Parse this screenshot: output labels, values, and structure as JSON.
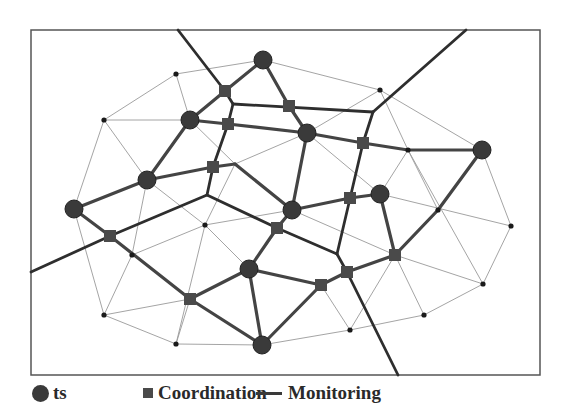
{
  "figure": {
    "type": "network-diagram",
    "frame": {
      "x": 31,
      "y": 30,
      "width": 509,
      "height": 345
    }
  },
  "legend": {
    "items": [
      {
        "symbol": "circle",
        "label": "ts"
      },
      {
        "symbol": "square",
        "label": "Coordination"
      },
      {
        "symbol": "line",
        "label": "Monitoring"
      }
    ]
  },
  "colors": {
    "ts_node": "#3a3a3a",
    "coordination_node": "#4a4a4a",
    "monitoring_line": "#2e2e2e",
    "thick_edge": "#444444",
    "thin_edge": "#9a9a9a",
    "dot": "#1a1a1a",
    "frame": "#555555"
  },
  "nodes": {
    "ts": [
      [
        263,
        60
      ],
      [
        190,
        120
      ],
      [
        307,
        133
      ],
      [
        147,
        180
      ],
      [
        74,
        209
      ],
      [
        380,
        194
      ],
      [
        482,
        150
      ],
      [
        292,
        210
      ],
      [
        249,
        269
      ],
      [
        262,
        345
      ]
    ],
    "coordination": [
      [
        225,
        91
      ],
      [
        289,
        106
      ],
      [
        228,
        124
      ],
      [
        363,
        143
      ],
      [
        213,
        167
      ],
      [
        110,
        236
      ],
      [
        350,
        198
      ],
      [
        277,
        228
      ],
      [
        395,
        255
      ],
      [
        347,
        272
      ],
      [
        321,
        285
      ],
      [
        190,
        299
      ]
    ],
    "dots": [
      [
        176,
        74
      ],
      [
        104,
        120
      ],
      [
        380,
        90
      ],
      [
        511,
        226
      ],
      [
        483,
        284
      ],
      [
        424,
        315
      ],
      [
        350,
        330
      ],
      [
        104,
        315
      ],
      [
        176,
        344
      ],
      [
        205,
        225
      ],
      [
        132,
        255
      ],
      [
        408,
        150
      ],
      [
        438,
        210
      ]
    ]
  },
  "edges": {
    "monitoring": [
      [
        [
          178,
          30
        ],
        [
          225,
          91
        ]
      ],
      [
        [
          225,
          91
        ],
        [
          233,
          104
        ]
      ],
      [
        [
          233,
          104
        ],
        [
          373,
          112
        ]
      ],
      [
        [
          373,
          112
        ],
        [
          466,
          30
        ]
      ],
      [
        [
          373,
          112
        ],
        [
          363,
          143
        ]
      ],
      [
        [
          363,
          143
        ],
        [
          337,
          254
        ]
      ],
      [
        [
          233,
          104
        ],
        [
          228,
          124
        ]
      ],
      [
        [
          228,
          124
        ],
        [
          213,
          167
        ]
      ],
      [
        [
          213,
          167
        ],
        [
          207,
          195
        ]
      ],
      [
        [
          207,
          195
        ],
        [
          110,
          236
        ]
      ],
      [
        [
          110,
          236
        ],
        [
          31,
          272
        ]
      ],
      [
        [
          207,
          195
        ],
        [
          277,
          228
        ]
      ],
      [
        [
          277,
          228
        ],
        [
          337,
          254
        ]
      ],
      [
        [
          337,
          254
        ],
        [
          347,
          272
        ]
      ],
      [
        [
          347,
          272
        ],
        [
          398,
          375
        ]
      ]
    ],
    "thick": [
      [
        [
          263,
          60
        ],
        [
          225,
          91
        ]
      ],
      [
        [
          225,
          91
        ],
        [
          190,
          120
        ]
      ],
      [
        [
          263,
          60
        ],
        [
          289,
          106
        ]
      ],
      [
        [
          289,
          106
        ],
        [
          307,
          133
        ]
      ],
      [
        [
          190,
          120
        ],
        [
          228,
          124
        ]
      ],
      [
        [
          228,
          124
        ],
        [
          307,
          133
        ]
      ],
      [
        [
          307,
          133
        ],
        [
          363,
          143
        ]
      ],
      [
        [
          363,
          143
        ],
        [
          408,
          150
        ]
      ],
      [
        [
          408,
          150
        ],
        [
          482,
          150
        ]
      ],
      [
        [
          190,
          120
        ],
        [
          147,
          180
        ]
      ],
      [
        [
          147,
          180
        ],
        [
          213,
          167
        ]
      ],
      [
        [
          213,
          167
        ],
        [
          235,
          164
        ]
      ],
      [
        [
          235,
          164
        ],
        [
          292,
          210
        ]
      ],
      [
        [
          147,
          180
        ],
        [
          74,
          209
        ]
      ],
      [
        [
          74,
          209
        ],
        [
          110,
          236
        ]
      ],
      [
        [
          110,
          236
        ],
        [
          190,
          299
        ]
      ],
      [
        [
          307,
          133
        ],
        [
          292,
          210
        ]
      ],
      [
        [
          292,
          210
        ],
        [
          350,
          198
        ]
      ],
      [
        [
          350,
          198
        ],
        [
          380,
          194
        ]
      ],
      [
        [
          380,
          194
        ],
        [
          395,
          255
        ]
      ],
      [
        [
          482,
          150
        ],
        [
          438,
          210
        ]
      ],
      [
        [
          438,
          210
        ],
        [
          395,
          255
        ]
      ],
      [
        [
          395,
          255
        ],
        [
          347,
          272
        ]
      ],
      [
        [
          347,
          272
        ],
        [
          321,
          285
        ]
      ],
      [
        [
          292,
          210
        ],
        [
          277,
          228
        ]
      ],
      [
        [
          277,
          228
        ],
        [
          249,
          269
        ]
      ],
      [
        [
          249,
          269
        ],
        [
          190,
          299
        ]
      ],
      [
        [
          249,
          269
        ],
        [
          321,
          285
        ]
      ],
      [
        [
          190,
          299
        ],
        [
          262,
          345
        ]
      ],
      [
        [
          249,
          269
        ],
        [
          262,
          345
        ]
      ],
      [
        [
          321,
          285
        ],
        [
          262,
          345
        ]
      ]
    ],
    "thin": [
      [
        [
          176,
          74
        ],
        [
          263,
          60
        ]
      ],
      [
        [
          263,
          60
        ],
        [
          380,
          90
        ]
      ],
      [
        [
          176,
          74
        ],
        [
          104,
          120
        ]
      ],
      [
        [
          176,
          74
        ],
        [
          190,
          120
        ]
      ],
      [
        [
          104,
          120
        ],
        [
          190,
          120
        ]
      ],
      [
        [
          104,
          120
        ],
        [
          147,
          180
        ]
      ],
      [
        [
          104,
          120
        ],
        [
          74,
          209
        ]
      ],
      [
        [
          380,
          90
        ],
        [
          307,
          133
        ]
      ],
      [
        [
          380,
          90
        ],
        [
          408,
          150
        ]
      ],
      [
        [
          380,
          90
        ],
        [
          482,
          150
        ]
      ],
      [
        [
          190,
          120
        ],
        [
          235,
          164
        ]
      ],
      [
        [
          235,
          164
        ],
        [
          205,
          225
        ]
      ],
      [
        [
          307,
          133
        ],
        [
          235,
          164
        ]
      ],
      [
        [
          147,
          180
        ],
        [
          132,
          255
        ]
      ],
      [
        [
          147,
          180
        ],
        [
          205,
          225
        ]
      ],
      [
        [
          205,
          225
        ],
        [
          132,
          255
        ]
      ],
      [
        [
          205,
          225
        ],
        [
          292,
          210
        ]
      ],
      [
        [
          205,
          225
        ],
        [
          249,
          269
        ]
      ],
      [
        [
          205,
          225
        ],
        [
          176,
          344
        ]
      ],
      [
        [
          74,
          209
        ],
        [
          104,
          315
        ]
      ],
      [
        [
          132,
          255
        ],
        [
          104,
          315
        ]
      ],
      [
        [
          104,
          315
        ],
        [
          190,
          299
        ]
      ],
      [
        [
          104,
          315
        ],
        [
          176,
          344
        ]
      ],
      [
        [
          176,
          344
        ],
        [
          262,
          345
        ]
      ],
      [
        [
          190,
          299
        ],
        [
          176,
          344
        ]
      ],
      [
        [
          307,
          133
        ],
        [
          380,
          194
        ]
      ],
      [
        [
          408,
          150
        ],
        [
          380,
          194
        ]
      ],
      [
        [
          408,
          150
        ],
        [
          483,
          284
        ]
      ],
      [
        [
          292,
          210
        ],
        [
          395,
          255
        ]
      ],
      [
        [
          380,
          194
        ],
        [
          511,
          226
        ]
      ],
      [
        [
          482,
          150
        ],
        [
          511,
          226
        ]
      ],
      [
        [
          511,
          226
        ],
        [
          483,
          284
        ]
      ],
      [
        [
          395,
          255
        ],
        [
          483,
          284
        ]
      ],
      [
        [
          395,
          255
        ],
        [
          424,
          315
        ]
      ],
      [
        [
          438,
          210
        ],
        [
          408,
          150
        ]
      ],
      [
        [
          483,
          284
        ],
        [
          424,
          315
        ]
      ],
      [
        [
          424,
          315
        ],
        [
          350,
          330
        ]
      ],
      [
        [
          350,
          330
        ],
        [
          262,
          345
        ]
      ],
      [
        [
          350,
          330
        ],
        [
          395,
          255
        ]
      ],
      [
        [
          321,
          285
        ],
        [
          350,
          330
        ]
      ],
      [
        [
          249,
          269
        ],
        [
          292,
          210
        ]
      ]
    ]
  }
}
